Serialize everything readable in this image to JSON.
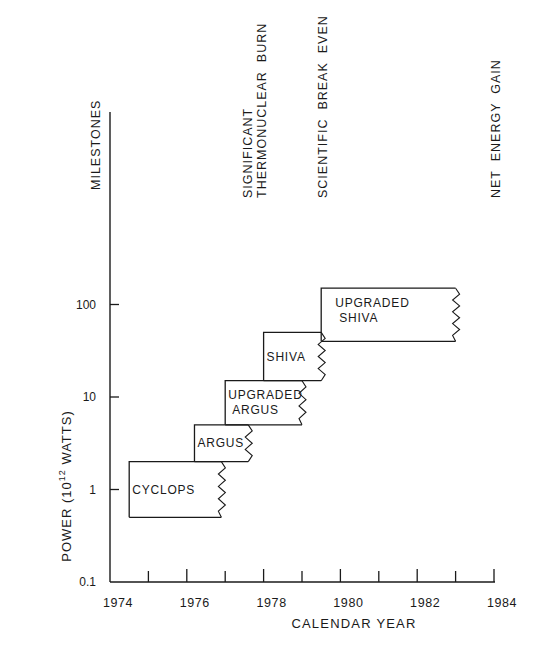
{
  "chart_data": {
    "type": "bar",
    "subtype": "floating-range-steps",
    "title": "",
    "xlabel": "CALENDAR YEAR",
    "ylabel": "POWER (10^12 WATTS)",
    "ylabel_parts": {
      "prefix": "POWER (10",
      "sup": "12",
      "suffix": " WATTS)"
    },
    "yscale": "log",
    "xlim": [
      1974,
      1984
    ],
    "ylim": [
      0.1,
      1000
    ],
    "x_ticks": [
      "1974",
      "1976",
      "1978",
      "1980",
      "1982",
      "1984"
    ],
    "x_ticks_values": [
      1974,
      1976,
      1978,
      1980,
      1982,
      1984
    ],
    "x_minor_ticks": [
      1975,
      1977,
      1979,
      1981,
      1983
    ],
    "y_ticks": [
      "0.1",
      "1",
      "10",
      "100"
    ],
    "y_ticks_values": [
      0.1,
      1,
      10,
      100
    ],
    "grid": false,
    "legend": null,
    "series": [
      {
        "name": "CYCLOPS",
        "label_lines": [
          "CYCLOPS"
        ],
        "x_start": 1974.5,
        "x_end": 1976.9,
        "y_low": 0.5,
        "y_high": 2
      },
      {
        "name": "ARGUS",
        "label_lines": [
          "ARGUS"
        ],
        "x_start": 1976.2,
        "x_end": 1977.6,
        "y_low": 2,
        "y_high": 5
      },
      {
        "name": "UPGRADED ARGUS",
        "label_lines": [
          "UPGRADED",
          "ARGUS"
        ],
        "x_start": 1977.0,
        "x_end": 1979.0,
        "y_low": 5,
        "y_high": 15
      },
      {
        "name": "SHIVA",
        "label_lines": [
          "SHIVA"
        ],
        "x_start": 1978.0,
        "x_end": 1979.5,
        "y_low": 15,
        "y_high": 50
      },
      {
        "name": "UPGRADED SHIVA",
        "label_lines": [
          "UPGRADED",
          "SHIVA"
        ],
        "x_start": 1979.5,
        "x_end": 1983.0,
        "y_low": 40,
        "y_high": 150
      }
    ],
    "annotations": {
      "milestones_header": "MILESTONES",
      "milestones": [
        {
          "lines": [
            "SIGNIFICANT",
            "THERMONUCLEAR  BURN"
          ],
          "year": 1978.2
        },
        {
          "lines": [
            "SCIENTIFIC  BREAK  EVEN"
          ],
          "year": 1979.5
        },
        {
          "lines": [
            "NET  ENERGY  GAIN"
          ],
          "year": 1983.0
        }
      ]
    }
  }
}
